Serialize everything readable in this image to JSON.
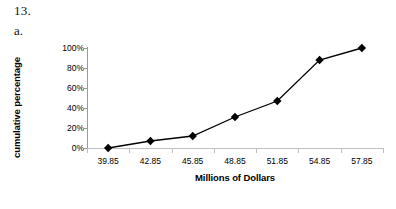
{
  "worksheet": {
    "problem_number": "13.",
    "part_letter": "a."
  },
  "chart_data": {
    "type": "line",
    "title": "",
    "xlabel": "Millions of Dollars",
    "ylabel": "cumulative percentage",
    "categories": [
      "39.85",
      "42.85",
      "45.85",
      "48.85",
      "51.85",
      "54.85",
      "57.85"
    ],
    "values": [
      0,
      7,
      12,
      31,
      47,
      88,
      100
    ],
    "ylim": [
      0,
      100
    ],
    "ytick_labels": [
      "0%",
      "20%",
      "40%",
      "60%",
      "80%",
      "100%"
    ],
    "ytick_values": [
      0,
      20,
      40,
      60,
      80,
      100
    ],
    "grid": false,
    "legend": false,
    "marker": "diamond",
    "marker_color": "#000000",
    "line_color": "#000000",
    "axis_color": "#9a9a9a",
    "background": "#ffffff"
  }
}
